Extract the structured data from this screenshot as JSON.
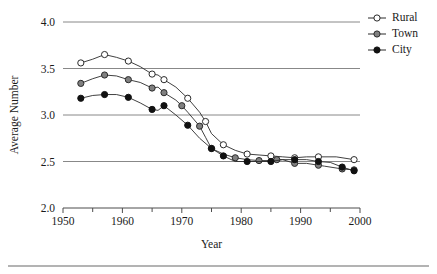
{
  "figure": {
    "width": 437,
    "height": 274,
    "background": "#ffffff",
    "footer_rule": true
  },
  "chart_data": {
    "type": "line",
    "title": "",
    "xlabel": "Year",
    "ylabel": "Average Number",
    "xlim": [
      1950,
      2000
    ],
    "ylim": [
      2.0,
      4.0
    ],
    "xticks": [
      1950,
      1960,
      1970,
      1980,
      1990,
      2000
    ],
    "xtick_labels": [
      "1950",
      "1960",
      "1970",
      "1980",
      "1990",
      "2000"
    ],
    "xminor_ticks": [
      1955,
      1965,
      1975,
      1985,
      1995
    ],
    "yticks": [
      2.0,
      2.5,
      3.0,
      3.5,
      4.0
    ],
    "ytick_labels": [
      "2.0",
      "2.5",
      "3.0",
      "3.5",
      "4.0"
    ],
    "grid": true,
    "gridlines_y": [
      2.5,
      3.0,
      3.5,
      4.0
    ],
    "grid_color": "#888888",
    "legend_position": "right-top",
    "series": [
      {
        "name": "Rural",
        "marker": "open-circle",
        "marker_face": "#ffffff",
        "marker_edge": "#2b2b2b",
        "line_color": "#2b2b2b",
        "x": [
          1953,
          1955,
          1957,
          1959,
          1961,
          1963,
          1965,
          1966,
          1967,
          1969,
          1971,
          1973,
          1974,
          1975,
          1977,
          1979,
          1981,
          1983,
          1985,
          1987,
          1989,
          1991,
          1993,
          1996,
          1999
        ],
        "y": [
          3.56,
          3.6,
          3.65,
          3.62,
          3.58,
          3.52,
          3.44,
          3.43,
          3.38,
          3.3,
          3.18,
          3.03,
          2.93,
          2.8,
          2.68,
          2.62,
          2.58,
          2.57,
          2.56,
          2.55,
          2.54,
          2.55,
          2.55,
          2.55,
          2.52
        ]
      },
      {
        "name": "Town",
        "marker": "filled-circle",
        "marker_face": "#808080",
        "marker_edge": "#2b2b2b",
        "line_color": "#2b2b2b",
        "x": [
          1953,
          1955,
          1957,
          1959,
          1961,
          1963,
          1965,
          1966,
          1967,
          1969,
          1970,
          1971,
          1973,
          1974,
          1975,
          1977,
          1979,
          1981,
          1983,
          1985,
          1986,
          1987,
          1989,
          1991,
          1993,
          1994,
          1997,
          1999
        ],
        "y": [
          3.34,
          3.39,
          3.43,
          3.42,
          3.38,
          3.35,
          3.29,
          3.3,
          3.24,
          3.16,
          3.1,
          3.03,
          2.88,
          2.76,
          2.64,
          2.58,
          2.54,
          2.52,
          2.51,
          2.51,
          2.52,
          2.52,
          2.48,
          2.48,
          2.46,
          2.45,
          2.42,
          2.41
        ]
      },
      {
        "name": "City",
        "marker": "filled-circle",
        "marker_face": "#111111",
        "marker_edge": "#111111",
        "line_color": "#2b2b2b",
        "x": [
          1953,
          1955,
          1957,
          1959,
          1961,
          1963,
          1965,
          1966,
          1967,
          1969,
          1971,
          1973,
          1975,
          1976,
          1977,
          1979,
          1981,
          1983,
          1985,
          1987,
          1989,
          1991,
          1993,
          1995,
          1997,
          1999
        ],
        "y": [
          3.18,
          3.21,
          3.22,
          3.22,
          3.19,
          3.13,
          3.06,
          3.05,
          3.1,
          3.0,
          2.89,
          2.75,
          2.64,
          2.6,
          2.56,
          2.5,
          2.5,
          2.5,
          2.5,
          2.52,
          2.52,
          2.52,
          2.5,
          2.49,
          2.44,
          2.4
        ]
      }
    ]
  },
  "legend": {
    "items": [
      {
        "label": "Rural",
        "marker": "open-circle"
      },
      {
        "label": "Town",
        "marker": "gray-circle"
      },
      {
        "label": "City",
        "marker": "black-circle"
      }
    ]
  }
}
